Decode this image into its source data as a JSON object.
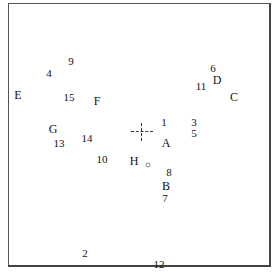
{
  "diagram": {
    "frame": {
      "left": 8,
      "top": 3,
      "right": 271,
      "bottom": 267
    },
    "crosshair": {
      "x": 142,
      "y": 132
    },
    "small_marker": {
      "x": 148,
      "y": 165
    },
    "letter_labels": [
      {
        "text": "A",
        "x": 166,
        "y": 143
      },
      {
        "text": "B",
        "x": 166,
        "y": 186
      },
      {
        "text": "C",
        "x": 234,
        "y": 97
      },
      {
        "text": "D",
        "x": 217,
        "y": 80
      },
      {
        "text": "E",
        "x": 18,
        "y": 95
      },
      {
        "text": "F",
        "x": 97,
        "y": 101
      },
      {
        "text": "G",
        "x": 53,
        "y": 129
      },
      {
        "text": "H",
        "x": 134,
        "y": 161
      }
    ],
    "number_labels": [
      {
        "text": "1",
        "x": 164,
        "y": 122
      },
      {
        "text": "2",
        "x": 85,
        "y": 253
      },
      {
        "text": "3",
        "x": 194,
        "y": 122
      },
      {
        "text": "4",
        "x": 49,
        "y": 73
      },
      {
        "text": "5",
        "x": 194,
        "y": 133
      },
      {
        "text": "6",
        "x": 213,
        "y": 68
      },
      {
        "text": "7",
        "x": 165,
        "y": 198
      },
      {
        "text": "8",
        "x": 169,
        "y": 172
      },
      {
        "text": "9",
        "x": 71,
        "y": 61
      },
      {
        "text": "10",
        "x": 102,
        "y": 159
      },
      {
        "text": "11",
        "x": 201,
        "y": 86
      },
      {
        "text": "12",
        "x": 159,
        "y": 264
      },
      {
        "text": "13",
        "x": 59,
        "y": 143
      },
      {
        "text": "14",
        "x": 87,
        "y": 138
      },
      {
        "text": "15",
        "x": 69,
        "y": 97
      }
    ]
  }
}
